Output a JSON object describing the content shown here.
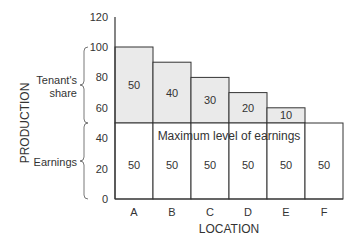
{
  "chart_data": {
    "type": "bar",
    "title": "",
    "xlabel": "LOCATION",
    "ylabel": "PRODUCTION",
    "categories": [
      "A",
      "B",
      "C",
      "D",
      "E",
      "F"
    ],
    "series": [
      {
        "name": "Earnings",
        "values": [
          50,
          50,
          50,
          50,
          50,
          50
        ],
        "color": "#ffffff"
      },
      {
        "name": "Tenant's share",
        "values": [
          50,
          40,
          30,
          20,
          10,
          0
        ],
        "color": "#eaeaea"
      }
    ],
    "totals": [
      100,
      90,
      80,
      70,
      60,
      50
    ],
    "stacked": true,
    "ylim": [
      0,
      120
    ],
    "yticks": [
      0,
      20,
      40,
      60,
      80,
      100,
      120
    ],
    "grid": false,
    "annotations": [
      {
        "text": "Maximum level of earnings",
        "y": 50
      },
      {
        "text": "Tenant's share",
        "type": "bracket",
        "range": [
          50,
          100
        ]
      },
      {
        "text": "Earnings",
        "type": "bracket",
        "range": [
          0,
          50
        ]
      }
    ]
  },
  "labels": {
    "tenants_share_line1": "Tenant's",
    "tenants_share_line2": "share",
    "earnings": "Earnings",
    "max_earnings": "Maximum level of earnings"
  }
}
